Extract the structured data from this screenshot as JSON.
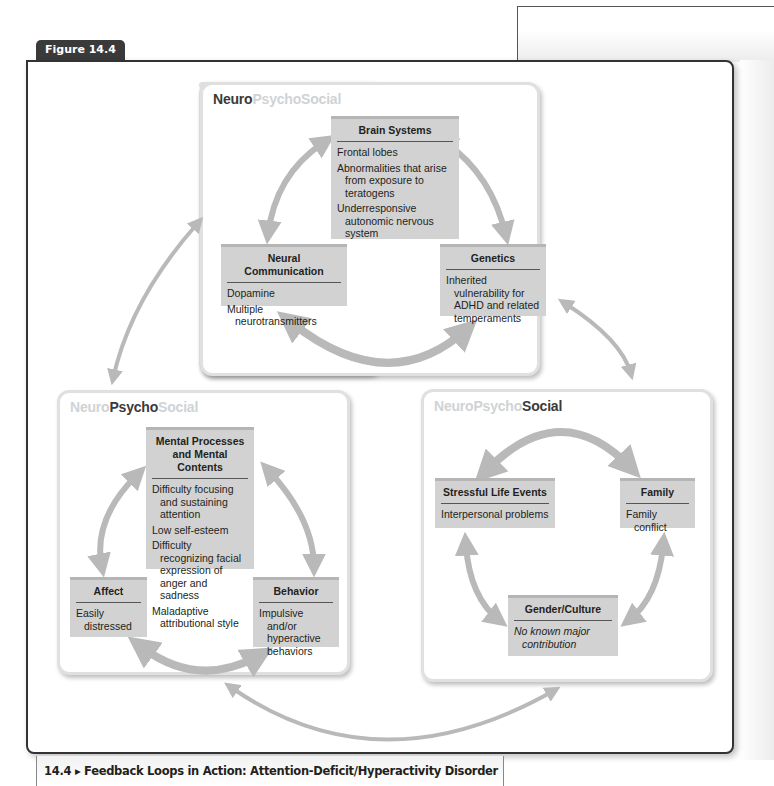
{
  "figure": {
    "tab_label": "Figure 14.4",
    "caption": "14.4 ▸ Feedback Loops in Action: Attention-Deficit/Hyperactivity Disorder"
  },
  "colors": {
    "box_fill": "#d2d2d2",
    "box_top_border": "#b5b5b5",
    "arrow": "#b9b9b9",
    "title_dim": "#cfd3d6",
    "title_strong": "#3a3a3a",
    "tab_bg": "#3a3a3a"
  },
  "panels": {
    "neuro": {
      "title_parts": [
        "Neuro",
        "PsychoSocial"
      ],
      "emphasis": "Neuro",
      "boxes": {
        "brain": {
          "heading": "Brain Systems",
          "items": [
            "Frontal lobes",
            "Abnormalities that arise from exposure to teratogens",
            "Underresponsive autonomic nervous system"
          ]
        },
        "neural": {
          "heading": "Neural Communication",
          "items": [
            "Dopamine",
            "Multiple neurotransmitters"
          ]
        },
        "genetics": {
          "heading": "Genetics",
          "items": [
            "Inherited vulnerability for ADHD and related temperaments"
          ]
        }
      }
    },
    "psycho": {
      "title_parts": [
        "Neuro",
        "Psycho",
        "Social"
      ],
      "emphasis": "Psycho",
      "boxes": {
        "mental": {
          "heading": "Mental Processes and Mental Contents",
          "items": [
            "Difficulty focusing and sustaining attention",
            "Low self-esteem",
            "Difficulty recognizing facial expression of anger and sadness",
            "Maladaptive attributional style"
          ]
        },
        "affect": {
          "heading": "Affect",
          "items": [
            "Easily distressed"
          ]
        },
        "behavior": {
          "heading": "Behavior",
          "items": [
            "Impulsive and/or hyperactive behaviors"
          ]
        }
      }
    },
    "social": {
      "title_parts": [
        "NeuroPsycho",
        "Social"
      ],
      "emphasis": "Social",
      "boxes": {
        "stress": {
          "heading": "Stressful Life Events",
          "items": [
            "Interpersonal problems"
          ]
        },
        "family": {
          "heading": "Family",
          "items": [
            "Family conflict"
          ]
        },
        "gender": {
          "heading": "Gender/Culture",
          "items": [
            "No known major contribution"
          ]
        }
      }
    }
  }
}
